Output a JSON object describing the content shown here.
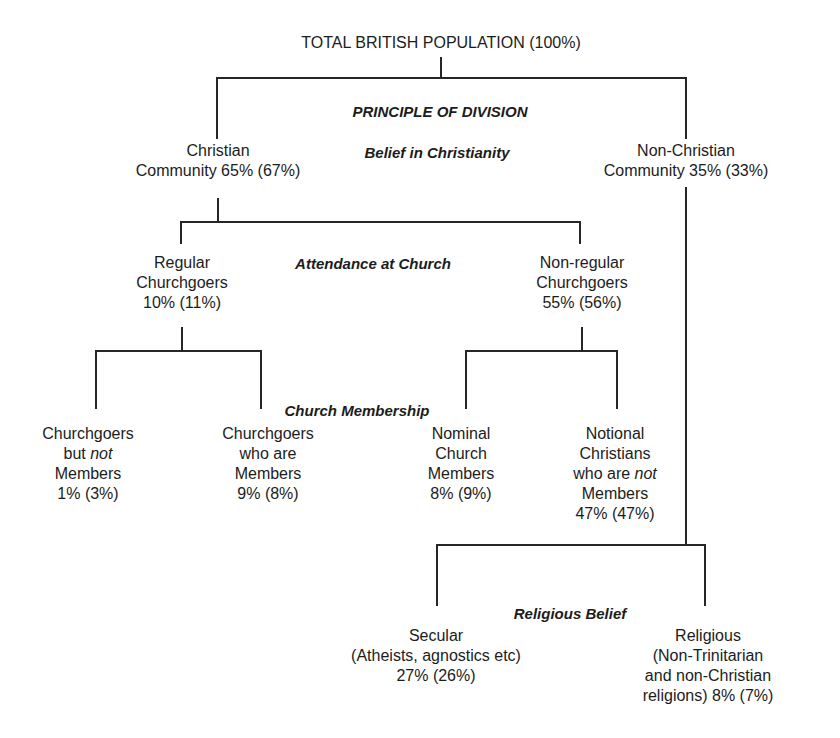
{
  "diagram": {
    "root": {
      "label": "TOTAL BRITISH POPULATION (100%)"
    },
    "principle_heading": "PRINCIPLE OF DIVISION",
    "divisions": {
      "belief_in_christianity": "Belief in Christianity",
      "attendance_at_church": "Attendance at Church",
      "church_membership": "Church Membership",
      "religious_belief": "Religious Belief"
    },
    "level1": {
      "christian": {
        "lines": [
          "Christian",
          "Community 65% (67%)"
        ]
      },
      "non_christian": {
        "lines": [
          "Non-Christian",
          "Community 35% (33%)"
        ]
      }
    },
    "level2": {
      "regular": {
        "lines": [
          "Regular",
          "Churchgoers",
          "10% (11%)"
        ]
      },
      "non_regular": {
        "lines": [
          "Non-regular",
          "Churchgoers",
          "55% (56%)"
        ]
      }
    },
    "level3": {
      "churchgoers_not_members": {
        "line1": "Churchgoers",
        "line2_prefix": "but ",
        "line2_em": "not",
        "line3": "Members",
        "line4": "1% (3%)"
      },
      "churchgoers_members": {
        "lines": [
          "Churchgoers",
          "who are",
          "Members",
          "9% (8%)"
        ]
      },
      "nominal_members": {
        "lines": [
          "Nominal",
          "Church",
          "Members",
          "8% (9%)"
        ]
      },
      "notional_christians": {
        "line1": "Notional",
        "line2": "Christians",
        "line3_prefix": "who are ",
        "line3_em": "not",
        "line4": "Members",
        "line5": "47% (47%)"
      }
    },
    "level4": {
      "secular": {
        "lines": [
          "Secular",
          "(Atheists, agnostics etc)",
          "27% (26%)"
        ]
      },
      "religious": {
        "lines": [
          "Religious",
          "(Non-Trinitarian",
          "and non-Christian",
          "religions) 8% (7%)"
        ]
      }
    }
  },
  "colors": {
    "background": "#ffffff",
    "ink": "#1c1c1c",
    "lines": "#262626"
  }
}
